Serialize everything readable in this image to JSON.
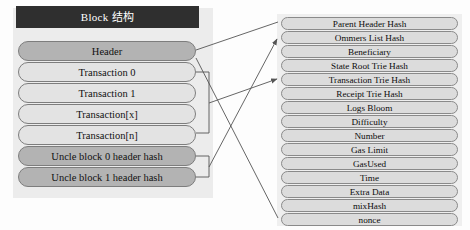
{
  "diagram": {
    "title": "Block 结构",
    "left_panel": {
      "name": "block-structure-panel",
      "rows": [
        {
          "label": "Header",
          "style": "dark"
        },
        {
          "label": "Transaction 0",
          "style": "light"
        },
        {
          "label": "Transaction 1",
          "style": "light"
        },
        {
          "label": "Transaction[x]",
          "style": "light"
        },
        {
          "label": "Transaction[n]",
          "style": "light"
        },
        {
          "label": "Uncle block 0 header hash",
          "style": "dark"
        },
        {
          "label": "Uncle block 1 header hash",
          "style": "dark"
        }
      ]
    },
    "right_panel": {
      "name": "block-header-fields-panel",
      "rows": [
        {
          "label": "Parent Header Hash"
        },
        {
          "label": "Ommers List Hash"
        },
        {
          "label": "Beneficiary"
        },
        {
          "label": "State Root Trie Hash"
        },
        {
          "label": "Transaction Trie Hash"
        },
        {
          "label": "Receipt Trie Hash"
        },
        {
          "label": "Logs Bloom"
        },
        {
          "label": "Difficulty"
        },
        {
          "label": "Number"
        },
        {
          "label": "Gas Limit"
        },
        {
          "label": "GasUsed"
        },
        {
          "label": "Time"
        },
        {
          "label": "Extra Data"
        },
        {
          "label": "mixHash"
        },
        {
          "label": "nonce"
        }
      ]
    },
    "colors": {
      "title_bar_bg": "#2f2f2f",
      "title_bar_text": "#ffffff",
      "row_dark": "#b3b3b3",
      "row_light": "#e3e3e3",
      "row_right": "#dcdcdc",
      "panel_bg": "#ececec",
      "outline": "#7d7d7d",
      "connector": "#555555"
    }
  }
}
